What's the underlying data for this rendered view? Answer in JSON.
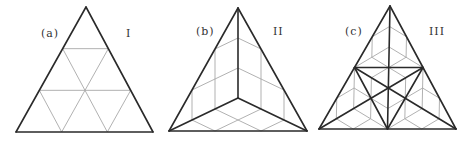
{
  "panels": [
    {
      "letter": "(a)",
      "numeral": "I"
    },
    {
      "letter": "(b)",
      "numeral": "II"
    },
    {
      "letter": "(c)",
      "numeral": "III"
    }
  ],
  "colors": {
    "thick": "#2a2a2a",
    "thin": "#a8a8a8"
  }
}
